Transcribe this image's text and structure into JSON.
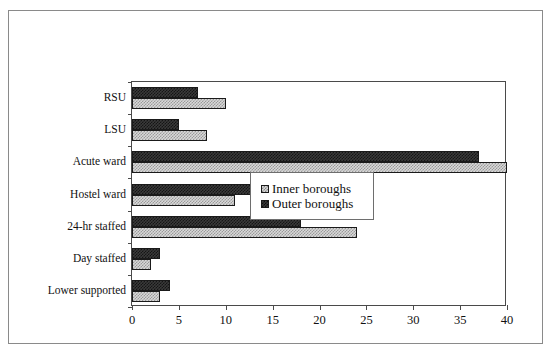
{
  "figure": {
    "ghost_top_text": "",
    "frame_color": "#8a8a8a",
    "plot_border_color": "#4a4a4a"
  },
  "legend": {
    "position": "inside-lower-right",
    "entries": [
      {
        "label": "Inner boroughs",
        "swatch": "light-checker-swatch",
        "color": "#d8d8d8"
      },
      {
        "label": "Outer boroughs",
        "swatch": "dark-checker-swatch",
        "color": "#3a3a3a"
      }
    ]
  },
  "chart_data": {
    "type": "bar",
    "orientation": "horizontal",
    "title": "",
    "subtitle": "",
    "xlabel": "",
    "ylabel": "",
    "xlim": [
      0,
      40
    ],
    "xticks": [
      0,
      5,
      10,
      15,
      20,
      25,
      30,
      35,
      40
    ],
    "xtick_labels": [
      "0",
      "5",
      "10",
      "15",
      "20",
      "25",
      "30",
      "35",
      "40"
    ],
    "grid": false,
    "legend_position": "lower right inside axes",
    "categories": [
      "RSU",
      "LSU",
      "Acute ward",
      "Hostel ward",
      "24-hr staffed",
      "Day staffed",
      "Lower supported"
    ],
    "series": [
      {
        "name": "Inner boroughs",
        "color": "#d8d8d8",
        "pattern": "light-checker",
        "values": [
          10,
          8,
          40,
          11,
          24,
          2,
          3
        ]
      },
      {
        "name": "Outer boroughs",
        "color": "#3a3a3a",
        "pattern": "dark-checker",
        "values": [
          7,
          5,
          37,
          24,
          18,
          3,
          4
        ]
      }
    ]
  }
}
